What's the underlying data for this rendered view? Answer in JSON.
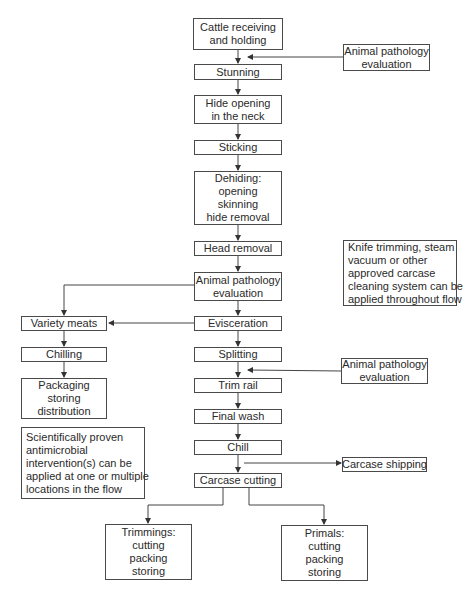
{
  "diagram": {
    "type": "flowchart",
    "main_flow": [
      {
        "id": "cattle",
        "lines": [
          "Cattle receiving",
          "and holding"
        ]
      },
      {
        "id": "stunning",
        "lines": [
          "Stunning"
        ]
      },
      {
        "id": "hide-opening",
        "lines": [
          "Hide opening",
          "in the neck"
        ]
      },
      {
        "id": "sticking",
        "lines": [
          "Sticking"
        ]
      },
      {
        "id": "dehiding",
        "lines": [
          "Dehiding:",
          "opening",
          "skinning",
          "hide removal"
        ]
      },
      {
        "id": "head-removal",
        "lines": [
          "Head removal"
        ]
      },
      {
        "id": "pathology-center",
        "lines": [
          "Animal pathology",
          "evaluation"
        ]
      },
      {
        "id": "evisceration",
        "lines": [
          "Evisceration"
        ]
      },
      {
        "id": "splitting",
        "lines": [
          "Splitting"
        ]
      },
      {
        "id": "trim-rail",
        "lines": [
          "Trim rail"
        ]
      },
      {
        "id": "final-wash",
        "lines": [
          "Final wash"
        ]
      },
      {
        "id": "chill",
        "lines": [
          "Chill"
        ]
      },
      {
        "id": "carcase-cutting",
        "lines": [
          "Carcase cutting"
        ]
      }
    ],
    "side_inputs": [
      {
        "id": "pathology-top",
        "lines": [
          "Animal pathology",
          "evaluation"
        ],
        "feeds_between": [
          "cattle",
          "stunning"
        ]
      },
      {
        "id": "pathology-mid",
        "lines": [
          "Animal pathology",
          "evaluation"
        ],
        "feeds_between": [
          "splitting",
          "trim-rail"
        ]
      }
    ],
    "branch_left": [
      {
        "id": "variety-meats",
        "lines": [
          "Variety meats"
        ]
      },
      {
        "id": "chilling",
        "lines": [
          "Chilling"
        ]
      },
      {
        "id": "packaging",
        "lines": [
          "Packaging",
          "storing",
          "distribution"
        ]
      }
    ],
    "outputs": [
      {
        "id": "carcase-shipping",
        "lines": [
          "Carcase shipping"
        ],
        "from_between": [
          "chill",
          "carcase-cutting"
        ]
      },
      {
        "id": "trimmings",
        "lines": [
          "Trimmings:",
          "cutting",
          "packing",
          "storing"
        ]
      },
      {
        "id": "primals",
        "lines": [
          "Primals:",
          "cutting",
          "packing",
          "storing"
        ]
      }
    ],
    "notes": [
      {
        "id": "knife-note",
        "lines": [
          "Knife trimming, steam",
          "vacuum or other",
          "approved carcase",
          "cleaning system can be",
          "applied throughout flow"
        ]
      },
      {
        "id": "antimicrobial-note",
        "lines": [
          "Scientifically proven",
          "antimicrobial",
          "intervention(s) can be",
          "applied at one or multiple",
          "locations in the flow"
        ]
      }
    ]
  }
}
